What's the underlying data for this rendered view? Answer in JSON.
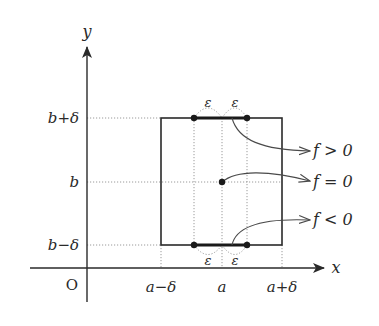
{
  "diagram": {
    "axes": {
      "x_label": "x",
      "y_label": "y",
      "origin_label": "O"
    },
    "x_ticks": {
      "left": "a−δ",
      "center": "a",
      "right": "a+δ"
    },
    "y_ticks": {
      "top": "b+δ",
      "center": "b",
      "bottom": "b−δ"
    },
    "epsilon_labels": {
      "top_left": "ε",
      "top_right": "ε",
      "bottom_left": "ε",
      "bottom_right": "ε"
    },
    "annotations": {
      "positive": "f > 0",
      "zero": "f = 0",
      "negative": "f < 0"
    },
    "colors": {
      "line": "#2a2a2a",
      "dotted": "#9a9a9a",
      "arrow": "#4a4a4a"
    }
  }
}
